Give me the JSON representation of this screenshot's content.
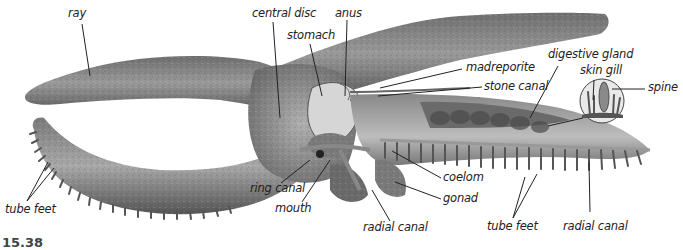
{
  "figure": {
    "number_partial": "15.38"
  },
  "labels": {
    "ray": "ray",
    "central_disc": "central disc",
    "anus": "anus",
    "stomach": "stomach",
    "madreporite": "madreporite",
    "stone_canal": "stone canal",
    "digestive_gland": "digestive gland",
    "skin_gill": "skin gill",
    "spine": "spine",
    "tube_feet_left": "tube feet",
    "ring_canal": "ring canal",
    "mouth": "mouth",
    "radial_canal_center": "radial canal",
    "coelom": "coelom",
    "gonad": "gonad",
    "tube_feet_right": "tube feet",
    "radial_canal_right": "radial canal"
  },
  "colors": {
    "body_dark": "#5a5a5a",
    "body_mid": "#8a8a8a",
    "body_light": "#c4c4c4",
    "leader_line": "#222222",
    "background": "#ffffff"
  }
}
